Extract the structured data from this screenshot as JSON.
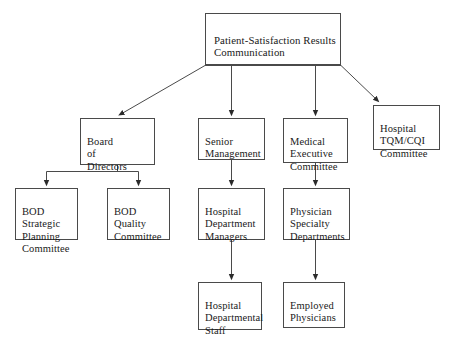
{
  "diagram": {
    "stroke_color": "#4a4a4a",
    "text_color": "#1a1a1a",
    "background_color": "#ffffff",
    "nodes": [
      {
        "id": "root",
        "label": "Patient-Satisfaction Results\nCommunication",
        "x": 205,
        "y": 13,
        "w": 136,
        "h": 52
      },
      {
        "id": "board-of-directors",
        "label": "Board\nof\nDirectors",
        "x": 80,
        "y": 118,
        "w": 75,
        "h": 47
      },
      {
        "id": "senior-management",
        "label": "Senior\nManagement",
        "x": 198,
        "y": 118,
        "w": 67,
        "h": 42
      },
      {
        "id": "medical-executive-committee",
        "label": "Medical\nExecutive\nCommittee",
        "x": 283,
        "y": 118,
        "w": 65,
        "h": 45
      },
      {
        "id": "hospital-tqm-cqi-committee",
        "label": "Hospital\nTQM/CQI\nCommittee",
        "x": 373,
        "y": 105,
        "w": 67,
        "h": 45
      },
      {
        "id": "bod-strategic-planning-committee",
        "label": "BOD\nStrategic\nPlanning\nCommittee",
        "x": 15,
        "y": 188,
        "w": 63,
        "h": 52
      },
      {
        "id": "bod-quality-committee",
        "label": "BOD\nQuality\nCommittee",
        "x": 107,
        "y": 188,
        "w": 63,
        "h": 52
      },
      {
        "id": "hospital-department-managers",
        "label": "Hospital\nDepartment\nManagers",
        "x": 198,
        "y": 188,
        "w": 67,
        "h": 52
      },
      {
        "id": "physician-specialty-departments",
        "label": "Physician\nSpecialty\nDepartments",
        "x": 283,
        "y": 188,
        "w": 67,
        "h": 52
      },
      {
        "id": "hospital-departmental-staff",
        "label": "Hospital\nDepartmental\nStaff",
        "x": 198,
        "y": 282,
        "w": 64,
        "h": 48
      },
      {
        "id": "employed-physicians",
        "label": "Employed\nPhysicians",
        "x": 283,
        "y": 282,
        "w": 62,
        "h": 46
      }
    ],
    "connectors": [
      {
        "id": "root-to-board-of-directors",
        "from": "root",
        "to": "board-of-directors",
        "style": "diagonal"
      },
      {
        "id": "root-to-senior-management",
        "from": "root",
        "to": "senior-management",
        "style": "vertical"
      },
      {
        "id": "root-to-medical-executive-committee",
        "from": "root",
        "to": "medical-executive-committee",
        "style": "vertical"
      },
      {
        "id": "root-to-hospital-tqm-cqi-committee",
        "from": "root",
        "to": "hospital-tqm-cqi-committee",
        "style": "diagonal"
      },
      {
        "id": "board-to-bod-strategic-planning",
        "from": "board-of-directors",
        "to": "bod-strategic-planning-committee",
        "style": "bus"
      },
      {
        "id": "board-to-bod-quality",
        "from": "board-of-directors",
        "to": "bod-quality-committee",
        "style": "bus"
      },
      {
        "id": "senior-management-to-hospital-department-managers",
        "from": "senior-management",
        "to": "hospital-department-managers",
        "style": "vertical"
      },
      {
        "id": "medical-executive-to-physician-specialty",
        "from": "medical-executive-committee",
        "to": "physician-specialty-departments",
        "style": "vertical"
      },
      {
        "id": "hospital-department-managers-to-staff",
        "from": "hospital-department-managers",
        "to": "hospital-departmental-staff",
        "style": "vertical"
      },
      {
        "id": "physician-specialty-to-employed-physicians",
        "from": "physician-specialty-departments",
        "to": "employed-physicians",
        "style": "vertical"
      }
    ]
  }
}
